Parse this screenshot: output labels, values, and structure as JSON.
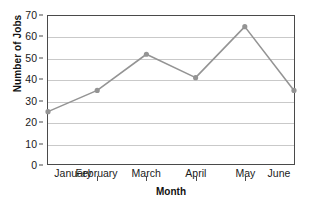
{
  "chart_data": {
    "type": "line",
    "title": "",
    "xlabel": "Month",
    "ylabel": "Number of Jobs",
    "categories": [
      "January",
      "February",
      "March",
      "April",
      "May",
      "June"
    ],
    "values": [
      25,
      35,
      52,
      41,
      65,
      35
    ],
    "series": [
      {
        "name": "Number of Jobs",
        "values": [
          25,
          35,
          52,
          41,
          65,
          35
        ]
      }
    ],
    "ylim": [
      0,
      70
    ],
    "ytick_labels": [
      "0",
      "10",
      "20",
      "30",
      "40",
      "50",
      "60",
      "70"
    ],
    "ytick_values": [
      0,
      10,
      20,
      30,
      40,
      50,
      60,
      70
    ],
    "grid": "horizontal",
    "legend": "none",
    "line_color": "#949494",
    "marker_color": "#949494",
    "marker": "circle",
    "gridline_color": "#c9c9c9",
    "frame_color": "#4a4a4a"
  }
}
